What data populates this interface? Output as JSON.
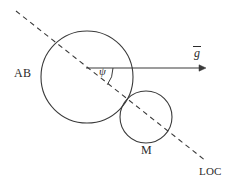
{
  "figure": {
    "type": "geometry-diagram",
    "background_color": "#ffffff",
    "stroke_color": "#2b2b2b",
    "labels": {
      "large_body": "AB",
      "small_body": "M",
      "line_of_centers": "LOC",
      "angle": "ψ",
      "gravity_vector": "g"
    },
    "elements": {
      "large_circle": {
        "name": "large-circle",
        "cx": 87,
        "cy": 77,
        "r": 46,
        "style": "solid"
      },
      "small_circle": {
        "name": "small-circle",
        "cx": 146,
        "cy": 117,
        "r": 26,
        "style": "solid"
      },
      "dashed_line": {
        "name": "line-of-centers",
        "x1": 16,
        "y1": 11,
        "x2": 206,
        "y2": 161,
        "style": "dashed"
      },
      "gravity_arrow": {
        "name": "gravity-vector-arrow",
        "x1": 86,
        "y1": 68,
        "x2": 206,
        "y2": 68,
        "style": "solid-with-arrowhead"
      },
      "angle_arc": {
        "name": "angle-arc",
        "cx": 86,
        "cy": 68,
        "r": 27,
        "from_deg": 0,
        "to_deg": 38
      }
    }
  }
}
